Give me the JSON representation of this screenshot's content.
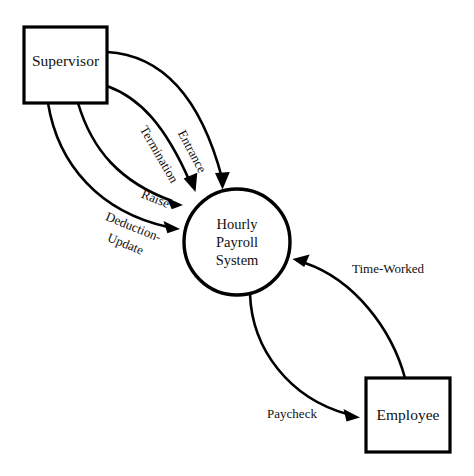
{
  "diagram": {
    "type": "data-flow-diagram",
    "background_color": "#ffffff",
    "line_color": "#000000",
    "nodes": [
      {
        "id": "supervisor",
        "kind": "external-entity",
        "shape": "rectangle",
        "label": "Supervisor"
      },
      {
        "id": "hourly-payroll-system",
        "kind": "process",
        "shape": "circle",
        "label": "Hourly Payroll System",
        "label_lines": [
          "Hourly",
          "Payroll",
          "System"
        ]
      },
      {
        "id": "employee",
        "kind": "external-entity",
        "shape": "rectangle",
        "label": "Employee"
      }
    ],
    "flows": [
      {
        "id": "entrance",
        "label": "Entrance",
        "from": "supervisor",
        "to": "hourly-payroll-system"
      },
      {
        "id": "termination",
        "label": "Termination",
        "from": "supervisor",
        "to": "hourly-payroll-system"
      },
      {
        "id": "raise",
        "label": "Raise",
        "from": "supervisor",
        "to": "hourly-payroll-system"
      },
      {
        "id": "deduction-update",
        "label": "Deduction-Update",
        "label_lines": [
          "Deduction-",
          "Update"
        ],
        "from": "supervisor",
        "to": "hourly-payroll-system"
      },
      {
        "id": "time-worked",
        "label": "Time-Worked",
        "from": "employee",
        "to": "hourly-payroll-system"
      },
      {
        "id": "paycheck",
        "label": "Paycheck",
        "from": "hourly-payroll-system",
        "to": "employee"
      }
    ]
  }
}
